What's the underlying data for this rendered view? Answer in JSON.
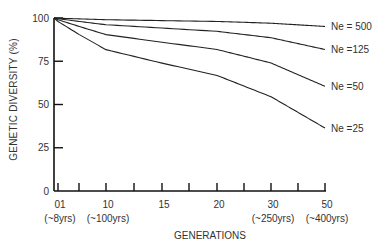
{
  "chart_data": {
    "type": "line",
    "title": "",
    "xlabel": "GENERATIONS",
    "ylabel": "GENETIC DIVERSITY (%)",
    "ylim": [
      0,
      100
    ],
    "yticks": [
      0,
      25,
      50,
      75,
      100
    ],
    "x_tick_labels": [
      {
        "gen": 1,
        "label": "01",
        "sub": "(~8yrs)"
      },
      {
        "gen": 10,
        "label": "10",
        "sub": "(~100yrs)"
      },
      {
        "gen": 15,
        "label": "15",
        "sub": ""
      },
      {
        "gen": 20,
        "label": "20",
        "sub": ""
      },
      {
        "gen": 30,
        "label": "30",
        "sub": "(~250yrs)"
      },
      {
        "gen": 50,
        "label": "50",
        "sub": "(~400yrs)"
      }
    ],
    "grid": false,
    "legend_position": "inline-right",
    "x": [
      0,
      1,
      5,
      10,
      15,
      20,
      30,
      50
    ],
    "series": [
      {
        "name": "Ne = 500",
        "values": [
          100,
          99.9,
          99.5,
          99.0,
          98.5,
          98.0,
          97.0,
          95.1
        ]
      },
      {
        "name": "Ne =125",
        "values": [
          100,
          99.6,
          98.0,
          96.1,
          94.2,
          92.3,
          88.6,
          81.8
        ]
      },
      {
        "name": "Ne =50",
        "values": [
          100,
          99.0,
          95.1,
          90.4,
          86.0,
          81.8,
          74.0,
          60.5
        ]
      },
      {
        "name": "Ne =25",
        "values": [
          100,
          98.0,
          90.4,
          81.7,
          73.9,
          66.8,
          54.5,
          36.4
        ]
      }
    ]
  }
}
